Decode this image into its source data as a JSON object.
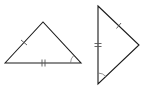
{
  "diagram": {
    "stroke_color": "#1a1a1a",
    "mark_color": "#555555",
    "triangles": [
      {
        "id": "left-triangle",
        "vertices": [
          [
            5,
            63
          ],
          [
            43,
            22
          ],
          [
            81,
            63
          ]
        ],
        "marks": {
          "single_tick_side": "left",
          "double_tick_side": "base",
          "angle_arc_vertex": "bottom-right"
        }
      },
      {
        "id": "right-triangle",
        "vertices": [
          [
            98,
            6
          ],
          [
            139,
            45
          ],
          [
            98,
            84
          ]
        ],
        "marks": {
          "single_tick_side": "upper-right",
          "double_tick_side": "left-vertical",
          "angle_arc_vertex": "bottom"
        }
      }
    ]
  }
}
